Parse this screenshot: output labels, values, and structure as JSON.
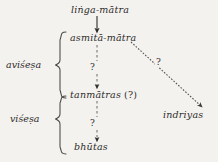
{
  "diagram": {
    "background_color": "#f3f2ef",
    "ink_color": "#2e2c2a",
    "nodes": {
      "linga_matra": "liṅga-mātra",
      "asmita_matra": "asmitā-mātra",
      "tanmatras": "tanmātras",
      "tanmatras_suffix": "(?)",
      "bhutas": "bhūtas",
      "indriyas": "indriyas"
    },
    "group_labels": {
      "avisesa": "aviśeṣa",
      "visesa": "viśeṣa"
    },
    "edge_labels": {
      "upper_question": "?",
      "lower_question": "?",
      "diagonal_question": "?"
    },
    "edges": [
      {
        "from": "liṅga-mātra",
        "to": "asmitā-mātra",
        "style": "solid",
        "label": ""
      },
      {
        "from": "asmitā-mātra",
        "to": "tanmātras",
        "style": "dashed",
        "label": "?"
      },
      {
        "from": "tanmātras",
        "to": "bhūtas",
        "style": "dashed",
        "label": "?"
      },
      {
        "from": "asmitā-mātra",
        "to": "indriyas",
        "style": "dotted-diagonal",
        "label": "?"
      }
    ],
    "braces": [
      {
        "label": "aviśeṣa",
        "spans": [
          "asmitā-mātra",
          "tanmātras"
        ]
      },
      {
        "label": "viśeṣa",
        "spans": [
          "tanmātras",
          "bhūtas"
        ]
      }
    ]
  }
}
